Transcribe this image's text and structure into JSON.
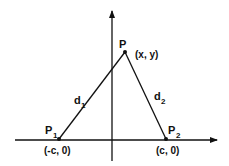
{
  "diagram": {
    "axes": {
      "x_axis": "horizontal",
      "y_axis": "vertical"
    },
    "points": {
      "p": {
        "label": "P",
        "coord": "(x, y)"
      },
      "p1": {
        "label": "P",
        "sub": "1",
        "coord": "(-c, 0)"
      },
      "p2": {
        "label": "P",
        "sub": "2",
        "coord": "(c, 0)"
      }
    },
    "segments": {
      "d1": {
        "label": "d",
        "sub": "1"
      },
      "d2": {
        "label": "d",
        "sub": "2"
      }
    },
    "colors": {
      "line": "#111111",
      "background": "#ffffff"
    }
  }
}
